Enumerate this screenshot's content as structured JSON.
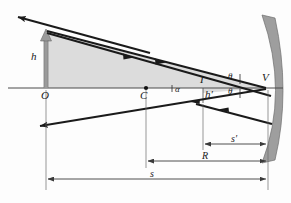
{
  "figure": {
    "kind": "optics-ray-diagram",
    "background_color": "#fdfdfd"
  },
  "colors": {
    "ray": "#1a1a1a",
    "axis": "#4a4a4a",
    "mirror_fill": "#9e9e9e",
    "mirror_edge": "#6e6e6e",
    "object_arrow": "#9a9a9a",
    "object_arrow_edge": "#6a6a6a",
    "shade_fill": "#dcdcdc",
    "dimension_line": "#3a3a3a",
    "label_text": "#1a1a1a"
  },
  "points": {
    "object_base": {
      "label": "O",
      "x": 46,
      "y": 88
    },
    "center_of_curvature": {
      "label": "C",
      "x": 146,
      "y": 88
    },
    "image_point": {
      "label": "I",
      "x": 203,
      "y": 88
    },
    "vertex": {
      "label": "V",
      "x": 266,
      "y": 88
    }
  },
  "heights": {
    "object": {
      "label": "h",
      "x": 36,
      "y": 56
    },
    "image": {
      "label": "h′",
      "x": 206,
      "y": 95
    }
  },
  "angles": {
    "alpha": {
      "label": "α",
      "x": 176,
      "y": 90
    },
    "theta_incident": {
      "label": "θ",
      "x": 228,
      "y": 78
    },
    "theta_reflected": {
      "label": "θ",
      "x": 228,
      "y": 92
    }
  },
  "dimensions": [
    {
      "name": "image-distance",
      "label": "s′",
      "label_x": 236,
      "label_y": 138,
      "y": 144,
      "x1": 203,
      "x2": 268
    },
    {
      "name": "radius-of-curvature",
      "label": "R",
      "label_x": 205,
      "label_y": 155,
      "y": 161,
      "x1": 146,
      "x2": 268
    },
    {
      "name": "object-distance",
      "label": "s",
      "label_x": 152,
      "label_y": 172,
      "y": 179,
      "x1": 46,
      "x2": 268
    }
  ],
  "axis": {
    "name": "optical-axis",
    "x1": 8,
    "x2": 283,
    "y": 88
  },
  "mirror": {
    "name": "concave-mirror",
    "outer_path": "M 262 15 Q 289 92 262 163 L 275 160 Q 291 92 275 18 Z"
  },
  "object_arrow": {
    "name": "object-arrow",
    "x": 46,
    "base_y": 88,
    "tip_y": 32
  },
  "rays": [
    {
      "name": "incident-ray-upper",
      "description": "ray from object tip to vertex V",
      "from": [
        46,
        32
      ],
      "to": [
        266,
        88
      ],
      "direction_marker_at": [
        160,
        61
      ]
    },
    {
      "name": "reflected-ray-upper",
      "description": "reflected ray from V back through image point, exiting lower-left",
      "from": [
        266,
        88
      ],
      "to": [
        33,
        128
      ],
      "direction_marker_at": [
        192,
        101
      ]
    },
    {
      "name": "incident-ray-through-center",
      "description": "ray from object tip through C to mirror",
      "from": [
        46,
        32
      ],
      "to": [
        270,
        95
      ],
      "direction_marker_at": [
        130,
        55
      ]
    },
    {
      "name": "reflected-ray-upper-left",
      "description": "ray leaving toward upper-left past object tip",
      "from": [
        148,
        52
      ],
      "to": [
        14,
        16
      ],
      "direction_marker_at": [
        40,
        23
      ]
    }
  ],
  "shaded_region": {
    "name": "shaded-triangle",
    "description": "gray shaded area bounded by object arrow, optical axis and incident ray"
  }
}
